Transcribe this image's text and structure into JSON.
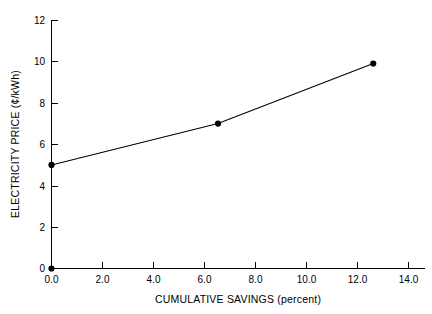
{
  "chart_data": {
    "type": "line",
    "title": "",
    "subtitle": "",
    "xlabel": "CUMULATIVE SAVINGS (percent)",
    "ylabel": "ELECTRICITY PRICE (¢/kWh)",
    "xlim": [
      0.0,
      16.6
    ],
    "ylim": [
      0,
      12
    ],
    "grid": false,
    "legend": null,
    "legend_position": "none",
    "x_ticks": [
      0.0,
      2.0,
      4.0,
      6.0,
      8.0,
      10.0,
      12.0,
      14.0
    ],
    "x_tick_labels": [
      "0.0",
      "2.0",
      "4.0",
      "6.0",
      "8.0",
      "10.0",
      "12.0",
      "14.0"
    ],
    "y_ticks": [
      0,
      2,
      4,
      6,
      8,
      10,
      12
    ],
    "y_tick_labels": [
      "0",
      "2",
      "4",
      "6",
      "8",
      "10",
      "12"
    ],
    "series": [
      {
        "name": "electricity price",
        "marker": "filled-circle",
        "x": [
          0.0,
          7.4,
          14.3
        ],
        "y": [
          5.0,
          7.0,
          9.9
        ]
      }
    ],
    "origin_marker": {
      "x": 0.0,
      "y": 0.0
    }
  },
  "axes": {
    "x_axis_name": "cumulative-savings-axis",
    "y_axis_name": "electricity-price-axis"
  }
}
